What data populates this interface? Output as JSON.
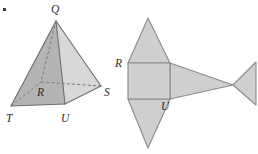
{
  "figure": {
    "background_color": "#ffffff",
    "corner_mark": {
      "name": "corner-dot",
      "x": 3,
      "y": 8,
      "size": 3,
      "color": "#3a3a3a"
    },
    "solid": {
      "name": "square-pyramid",
      "vertices": {
        "Q": {
          "label": "Q",
          "x": 56,
          "y": 21,
          "label_x": 51,
          "label_y": 13
        },
        "R": {
          "label": "R",
          "x": 41,
          "y": 82,
          "label_x": 37,
          "label_y": 96
        },
        "S": {
          "label": "S",
          "x": 101,
          "y": 86,
          "label_x": 104,
          "label_y": 96
        },
        "T": {
          "label": "T",
          "x": 11,
          "y": 106,
          "label_x": 6,
          "label_y": 122
        },
        "U": {
          "label": "U",
          "x": 65,
          "y": 104,
          "label_x": 61,
          "label_y": 122
        }
      },
      "faces": [
        {
          "name": "face-QTU-front-left",
          "points": "56,21 11,106 65,104",
          "fill": "#b4b4b4"
        },
        {
          "name": "face-QUS-front-right",
          "points": "56,21 65,104 101,86",
          "fill": "#d8d8d8"
        },
        {
          "name": "face-QTR-side",
          "points": "56,21 11,106 41,82",
          "fill": "#a8a8a8"
        },
        {
          "name": "base-TRSU",
          "points": "11,106 41,82 101,86 65,104",
          "fill": "#b0b0b0"
        }
      ],
      "solid_edges": [
        {
          "name": "edge-Q-T",
          "x1": 56,
          "y1": 21,
          "x2": 11,
          "y2": 106
        },
        {
          "name": "edge-Q-U",
          "x1": 56,
          "y1": 21,
          "x2": 65,
          "y2": 104
        },
        {
          "name": "edge-Q-S",
          "x1": 56,
          "y1": 21,
          "x2": 101,
          "y2": 86
        },
        {
          "name": "edge-T-U",
          "x1": 11,
          "y1": 106,
          "x2": 65,
          "y2": 104
        },
        {
          "name": "edge-U-S",
          "x1": 65,
          "y1": 104,
          "x2": 101,
          "y2": 86
        }
      ],
      "dashed_edges": [
        {
          "name": "edge-Q-R-hidden",
          "x1": 56,
          "y1": 21,
          "x2": 41,
          "y2": 82
        },
        {
          "name": "edge-T-R-hidden",
          "x1": 11,
          "y1": 106,
          "x2": 41,
          "y2": 82
        },
        {
          "name": "edge-R-S-hidden",
          "x1": 41,
          "y1": 82,
          "x2": 101,
          "y2": 86
        }
      ]
    },
    "net": {
      "name": "pyramid-net",
      "fill": "#cfcfcf",
      "stroke": "#8a8a8a",
      "labels": {
        "R": {
          "label": "R",
          "x": 120,
          "y": 67
        },
        "U": {
          "label": "U",
          "x": 163,
          "y": 110
        }
      },
      "square_base": {
        "name": "net-square-base",
        "points": "128,63 170,63 170,99 128,99"
      },
      "triangles": [
        {
          "name": "net-triangle-top",
          "points": "128,63 170,63 148,18"
        },
        {
          "name": "net-triangle-bottom",
          "points": "128,99 170,99 148,148"
        },
        {
          "name": "net-triangle-right-inner",
          "points": "170,63 170,99 233,85"
        },
        {
          "name": "net-triangle-right-outer",
          "points": "233,85 256,62 256,105"
        }
      ]
    }
  }
}
